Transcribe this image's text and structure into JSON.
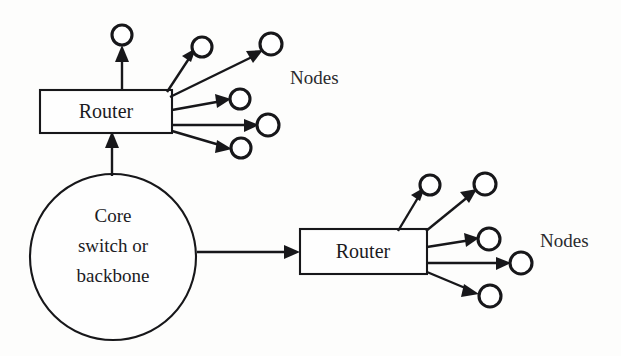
{
  "diagram": {
    "background_color": "#fdfdfc",
    "line_color": "#17171a",
    "fill_color": "#ffffff",
    "width": 621,
    "height": 356
  },
  "core": {
    "label_line1": "Core",
    "label_line2": "switch or",
    "label_line3": "backbone",
    "cx": 113,
    "cy": 257,
    "r": 83
  },
  "routers": [
    {
      "id": "router-top",
      "label": "Router",
      "x": 40,
      "y": 90,
      "width": 132,
      "height": 43,
      "node_count": 6
    },
    {
      "id": "router-bottom",
      "label": "Router",
      "x": 300,
      "y": 229,
      "width": 127,
      "height": 45,
      "node_count": 5
    }
  ],
  "labels": {
    "nodes_top": "Nodes",
    "nodes_bottom": "Nodes"
  },
  "nodes_top_group": [
    {
      "cx": 122,
      "cy": 35,
      "r": 10
    },
    {
      "cx": 202,
      "cy": 47,
      "r": 10
    },
    {
      "cx": 271,
      "cy": 44,
      "r": 11
    },
    {
      "cx": 240,
      "cy": 99,
      "r": 10
    },
    {
      "cx": 268,
      "cy": 125,
      "r": 11
    },
    {
      "cx": 241,
      "cy": 148,
      "r": 10
    }
  ],
  "nodes_bottom_group": [
    {
      "cx": 430,
      "cy": 185,
      "r": 10
    },
    {
      "cx": 485,
      "cy": 184,
      "r": 11
    },
    {
      "cx": 489,
      "cy": 239,
      "r": 11
    },
    {
      "cx": 521,
      "cy": 263,
      "r": 11
    },
    {
      "cx": 490,
      "cy": 296,
      "r": 11
    }
  ],
  "links": [
    {
      "from": "core",
      "to": "router-top",
      "direction": "up"
    },
    {
      "from": "core",
      "to": "router-bottom",
      "direction": "right"
    }
  ]
}
